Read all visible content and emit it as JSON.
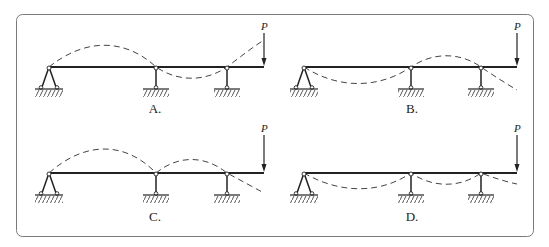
{
  "figure": {
    "frame": {
      "stroke": "#7a7a7a",
      "x": 16,
      "y": 14,
      "width": 517,
      "height": 222,
      "radius": 6
    },
    "colors": {
      "beam": "#222222",
      "deflection": "#444444",
      "hatch": "#555555"
    },
    "load_label": "P",
    "panels": [
      {
        "id": "A",
        "label": "A.",
        "beam": {
          "x1": 49,
          "x2": 264,
          "y": 67
        },
        "supports": [
          49,
          156,
          227
        ],
        "label_pos": {
          "x": 155,
          "y": 113
        },
        "load": {
          "x": 264,
          "y_top": 33
        },
        "deflection_path": "M49,67 C85,38 125,38 156,67 C178,82 205,82 227,67 C240,57 253,47 264,40"
      },
      {
        "id": "B",
        "label": "B.",
        "beam": {
          "x1": 304,
          "x2": 517,
          "y": 67
        },
        "supports": [
          304,
          411,
          481
        ],
        "label_pos": {
          "x": 412,
          "y": 113
        },
        "load": {
          "x": 517,
          "y_top": 33
        },
        "deflection_path": "M304,67 C340,90 380,88 411,67 C433,52 460,52 481,67 C494,76 507,84 517,90"
      },
      {
        "id": "C",
        "label": "C.",
        "beam": {
          "x1": 49,
          "x2": 264,
          "y": 173
        },
        "supports": [
          49,
          156,
          227
        ],
        "label_pos": {
          "x": 155,
          "y": 221
        },
        "load": {
          "x": 264,
          "y_top": 135
        },
        "deflection_path": "M49,173 C85,141 125,141 156,173 C178,155 205,155 227,173 C240,180 253,187 264,193"
      },
      {
        "id": "D",
        "label": "D.",
        "beam": {
          "x1": 304,
          "x2": 517,
          "y": 173
        },
        "supports": [
          304,
          411,
          481
        ],
        "label_pos": {
          "x": 412,
          "y": 221
        },
        "load": {
          "x": 517,
          "y_top": 135
        },
        "deflection_path": "M304,173 C340,194 380,194 411,173 C433,188 460,188 481,173 C494,178 507,182 517,184"
      }
    ]
  }
}
